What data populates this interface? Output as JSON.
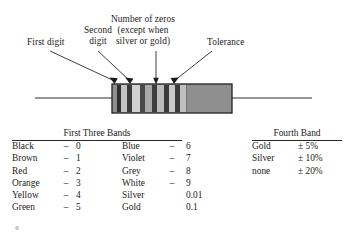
{
  "figure": {
    "callouts": [
      {
        "id": "first-digit",
        "text": "First digit"
      },
      {
        "id": "second-digit",
        "text": "Second\ndigit"
      },
      {
        "id": "number-of-zeros",
        "text": "Number of zeros\n(except when\nsilver or gold)"
      },
      {
        "id": "tolerance",
        "text": "Tolerance"
      }
    ],
    "resistor": {
      "body_color": "#9a9a9a",
      "outline_color": "#1e1e1e",
      "lead_color": "#2a2a2a",
      "bands": [
        {
          "index": 1,
          "role": "first-digit",
          "shade": "#2f2f2f"
        },
        {
          "index": 2,
          "role": "spacer",
          "shade": "#bdbdbd"
        },
        {
          "index": 3,
          "role": "second-digit",
          "shade": "#3a3a3a"
        },
        {
          "index": 4,
          "role": "spacer",
          "shade": "#cfcfcf"
        },
        {
          "index": 5,
          "role": "number-of-zeros",
          "shade": "#555555"
        },
        {
          "index": 6,
          "role": "spacer",
          "shade": "#b5b5b5"
        },
        {
          "index": 7,
          "role": "tolerance",
          "shade": "#3c3c3c"
        },
        {
          "index": 8,
          "role": "spacer",
          "shade": "#c4c4c4"
        }
      ]
    }
  },
  "tables": {
    "first_three_bands": {
      "heading": "First Three Bands",
      "left_rows": [
        {
          "color": "Black",
          "dash": "–",
          "value": "0"
        },
        {
          "color": "Brown",
          "dash": "–",
          "value": "1"
        },
        {
          "color": "Red",
          "dash": "–",
          "value": "2"
        },
        {
          "color": "Orange",
          "dash": "–",
          "value": "3"
        },
        {
          "color": "Yellow",
          "dash": "–",
          "value": "4"
        },
        {
          "color": "Green",
          "dash": "–",
          "value": "5"
        }
      ],
      "right_rows": [
        {
          "color": "Blue",
          "dash": "–",
          "value": "6"
        },
        {
          "color": "Violet",
          "dash": "–",
          "value": "7"
        },
        {
          "color": "Grey",
          "dash": "–",
          "value": "8"
        },
        {
          "color": "White",
          "dash": "–",
          "value": "9"
        },
        {
          "color": "Silver",
          "dash": "",
          "value": "0.01"
        },
        {
          "color": "Gold",
          "dash": "",
          "value": "0.1"
        }
      ]
    },
    "fourth_band": {
      "heading": "Fourth Band",
      "rows": [
        {
          "color": "Gold",
          "tolerance": "± 5%"
        },
        {
          "color": "Silver",
          "tolerance": "± 10%"
        },
        {
          "color": "none",
          "tolerance": "± 20%"
        }
      ]
    }
  }
}
